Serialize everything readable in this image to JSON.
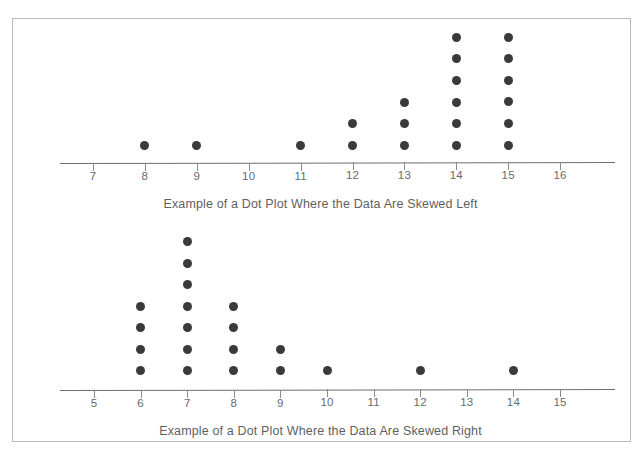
{
  "figure": {
    "frame_color": "#b9b9b9",
    "dot_color": "#3a3a3a",
    "axis_color": "#6e6e6e",
    "text_color": "#5f5f5f",
    "background": "#ffffff"
  },
  "chart_data": [
    {
      "type": "scatter",
      "plot_style": "dot-plot",
      "title": "Example of a Dot Plot Where the Data Are Skewed Left",
      "caption": "Example of a Dot Plot Where the Data Are Skewed Left",
      "xlabel": "",
      "ylabel": "",
      "grid": false,
      "legend": false,
      "xlim": [
        7,
        16
      ],
      "categories": [
        7,
        8,
        9,
        10,
        11,
        12,
        13,
        14,
        15,
        16
      ],
      "tick_labels": [
        "7",
        "8",
        "9",
        "10",
        "11",
        "12",
        "13",
        "14",
        "15",
        "16"
      ],
      "values": [
        0,
        1,
        1,
        0,
        1,
        2,
        3,
        6,
        6,
        0
      ],
      "total_count": 20,
      "skew": "left"
    },
    {
      "type": "scatter",
      "plot_style": "dot-plot",
      "title": "Example of a Dot Plot Where the Data Are Skewed Right",
      "caption": "Example of a Dot Plot Where the Data Are Skewed Right",
      "xlabel": "",
      "ylabel": "",
      "grid": false,
      "legend": false,
      "xlim": [
        5,
        15
      ],
      "categories": [
        5,
        6,
        7,
        8,
        9,
        10,
        11,
        12,
        13,
        14,
        15
      ],
      "tick_labels": [
        "5",
        "6",
        "7",
        "8",
        "9",
        "10",
        "11",
        "12",
        "13",
        "14",
        "15"
      ],
      "values": [
        0,
        4,
        7,
        4,
        2,
        1,
        0,
        1,
        0,
        1,
        0
      ],
      "total_count": 20,
      "skew": "right"
    }
  ],
  "top_plot": {
    "caption": "Example of a Dot Plot Where the Data Are Skewed Left"
  },
  "bottom_plot": {
    "caption": "Example of a Dot Plot Where the Data Are Skewed Right"
  }
}
